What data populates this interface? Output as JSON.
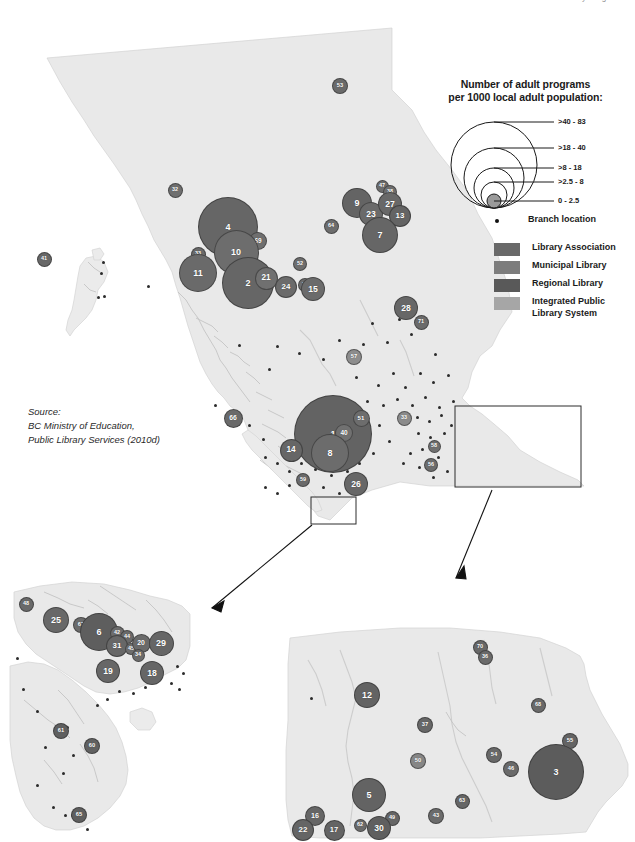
{
  "page": {
    "top_clipped_text": "Adult Library Programs",
    "background_color": "#ffffff",
    "land_color": "#e8e8e8",
    "land_stroke": "#c9c9c9"
  },
  "source_note": "Source:\nBC Ministry of Education,\nPublic Library Services (2010d)",
  "legend": {
    "title_line1": "Number of adult programs",
    "title_line2": "per 1000 local adult population:",
    "size_classes": [
      {
        "label": ">40 - 83",
        "radius": 43
      },
      {
        "label": ">18 - 40",
        "radius": 30
      },
      {
        "label": ">8 - 18",
        "radius": 20
      },
      {
        "label": ">2.5 - 8",
        "radius": 13
      },
      {
        "label": "0 - 2.5",
        "radius": 7
      }
    ],
    "branch_location_label": "Branch location",
    "branch_marker_icon": "square-dot-icon",
    "categories": [
      {
        "label": "Library Association",
        "color": "#696969"
      },
      {
        "label": "Municipal Library",
        "color": "#7d7d7d"
      },
      {
        "label": "Regional  Library",
        "color": "#595959"
      },
      {
        "label": "Integrated Public\nLibrary System",
        "color": "#a6a6a6"
      }
    ]
  },
  "main_map": {
    "name": "british-columbia-main-map",
    "bubbles": [
      {
        "id": "53",
        "x": 340,
        "y": 86,
        "r": 8,
        "color": "#6a6a6a"
      },
      {
        "id": "32",
        "x": 175,
        "y": 190,
        "r": 7.5,
        "color": "#6f6f6f"
      },
      {
        "id": "4",
        "x": 228,
        "y": 227,
        "r": 30,
        "color": "#666666"
      },
      {
        "id": "69",
        "x": 258,
        "y": 241,
        "r": 9,
        "color": "#6f6f6f"
      },
      {
        "id": "10",
        "x": 236,
        "y": 252,
        "r": 22.5,
        "color": "#6d6d6d"
      },
      {
        "id": "33",
        "x": 198,
        "y": 254,
        "r": 7.5,
        "color": "#6a6a6a"
      },
      {
        "id": "11",
        "x": 198,
        "y": 273,
        "r": 19,
        "color": "#6a6a6a"
      },
      {
        "id": "41",
        "x": 44,
        "y": 259,
        "r": 7.5,
        "color": "#686868"
      },
      {
        "id": "2",
        "x": 248,
        "y": 283,
        "r": 26,
        "color": "#666666"
      },
      {
        "id": "21",
        "x": 266,
        "y": 278,
        "r": 11.5,
        "color": "#707070"
      },
      {
        "id": "24",
        "x": 286,
        "y": 287,
        "r": 11,
        "color": "#6b6b6b"
      },
      {
        "id": "52",
        "x": 300,
        "y": 264,
        "r": 7,
        "color": "#6e6e6e"
      },
      {
        "id": "39",
        "x": 305,
        "y": 285,
        "r": 7,
        "color": "#6c6c6c"
      },
      {
        "id": "15",
        "x": 313,
        "y": 289,
        "r": 12,
        "color": "#6b6b6b"
      },
      {
        "id": "64",
        "x": 331,
        "y": 226,
        "r": 7.5,
        "color": "#6d6d6d"
      },
      {
        "id": "9",
        "x": 357,
        "y": 203,
        "r": 15,
        "color": "#646464"
      },
      {
        "id": "23",
        "x": 371,
        "y": 214,
        "r": 12,
        "color": "#6a6a6a"
      },
      {
        "id": "47",
        "x": 382,
        "y": 186,
        "r": 6.5,
        "color": "#6c6c6c"
      },
      {
        "id": "38",
        "x": 390,
        "y": 192,
        "r": 7,
        "color": "#6e6e6e"
      },
      {
        "id": "27",
        "x": 390,
        "y": 204,
        "r": 12,
        "color": "#686868"
      },
      {
        "id": "13",
        "x": 400,
        "y": 216,
        "r": 11,
        "color": "#646464"
      },
      {
        "id": "7",
        "x": 380,
        "y": 235,
        "r": 18,
        "color": "#666666"
      },
      {
        "id": "28",
        "x": 406,
        "y": 308,
        "r": 12,
        "color": "#676767"
      },
      {
        "id": "71",
        "x": 421,
        "y": 322,
        "r": 7.5,
        "color": "#6b6b6b"
      },
      {
        "id": "57",
        "x": 354,
        "y": 357,
        "r": 8,
        "color": "#8d8d8d"
      },
      {
        "id": "66",
        "x": 233,
        "y": 418,
        "r": 9.5,
        "color": "#6a6a6a"
      },
      {
        "id": "1",
        "x": 333,
        "y": 434,
        "r": 39,
        "color": "#636363"
      },
      {
        "id": "40",
        "x": 344,
        "y": 433,
        "r": 9,
        "color": "#717171"
      },
      {
        "id": "51",
        "x": 361,
        "y": 418,
        "r": 8.5,
        "color": "#6d6d6d"
      },
      {
        "id": "8",
        "x": 330,
        "y": 453,
        "r": 19,
        "color": "#6c6c6c"
      },
      {
        "id": "14",
        "x": 291,
        "y": 450,
        "r": 11.5,
        "color": "#666666"
      },
      {
        "id": "59",
        "x": 303,
        "y": 480,
        "r": 7,
        "color": "#6a6a6a"
      },
      {
        "id": "26",
        "x": 356,
        "y": 484,
        "r": 12,
        "color": "#676767"
      },
      {
        "id": "33b",
        "x": 404,
        "y": 418,
        "r": 7.5,
        "color": "#8b8b8b",
        "display": "33"
      },
      {
        "id": "58",
        "x": 434,
        "y": 446,
        "r": 6.5,
        "color": "#6f6f6f"
      },
      {
        "id": "56",
        "x": 431,
        "y": 465,
        "r": 7,
        "color": "#6d6d6d"
      }
    ],
    "callout_rects": [
      {
        "name": "vancouver-island-callout",
        "x": 311,
        "y": 497,
        "w": 45,
        "h": 27
      },
      {
        "name": "southern-interior-callout",
        "x": 455,
        "y": 406,
        "w": 126,
        "h": 81
      }
    ]
  },
  "inset_left": {
    "name": "vancouver-island-inset",
    "bubbles": [
      {
        "id": "48",
        "x": 26,
        "y": 604,
        "r": 7.5,
        "color": "#6a6a6a"
      },
      {
        "id": "25",
        "x": 56,
        "y": 620,
        "r": 13,
        "color": "#686868"
      },
      {
        "id": "67",
        "x": 81,
        "y": 625,
        "r": 8,
        "color": "#6c6c6c"
      },
      {
        "id": "6",
        "x": 99,
        "y": 632,
        "r": 19,
        "color": "#5e5e5e"
      },
      {
        "id": "42",
        "x": 117,
        "y": 633,
        "r": 7.5,
        "color": "#6d6d6d"
      },
      {
        "id": "44",
        "x": 127,
        "y": 637,
        "r": 7,
        "color": "#6a6a6a"
      },
      {
        "id": "31",
        "x": 117,
        "y": 646,
        "r": 11,
        "color": "#676767"
      },
      {
        "id": "45",
        "x": 131,
        "y": 649,
        "r": 6,
        "color": "#6e6e6e"
      },
      {
        "id": "20",
        "x": 141,
        "y": 643,
        "r": 9.5,
        "color": "#6a6a6a"
      },
      {
        "id": "34",
        "x": 138,
        "y": 655,
        "r": 6.5,
        "color": "#6b6b6b"
      },
      {
        "id": "29",
        "x": 161,
        "y": 643,
        "r": 12.5,
        "color": "#666666"
      },
      {
        "id": "19",
        "x": 108,
        "y": 671,
        "r": 12,
        "color": "#676767"
      },
      {
        "id": "18",
        "x": 152,
        "y": 673,
        "r": 12,
        "color": "#666666"
      },
      {
        "id": "61",
        "x": 61,
        "y": 731,
        "r": 8,
        "color": "#5f5f5f"
      },
      {
        "id": "60",
        "x": 92,
        "y": 746,
        "r": 8,
        "color": "#616161"
      },
      {
        "id": "65",
        "x": 79,
        "y": 815,
        "r": 8,
        "color": "#5f5f5f"
      }
    ]
  },
  "inset_right": {
    "name": "southern-interior-inset",
    "bubbles": [
      {
        "id": "70",
        "x": 480,
        "y": 647,
        "r": 7.5,
        "color": "#686868"
      },
      {
        "id": "36",
        "x": 485,
        "y": 657,
        "r": 7.5,
        "color": "#6a6a6a"
      },
      {
        "id": "12",
        "x": 367,
        "y": 695,
        "r": 13,
        "color": "#636363"
      },
      {
        "id": "68",
        "x": 538,
        "y": 705,
        "r": 7.5,
        "color": "#6a6a6a"
      },
      {
        "id": "37",
        "x": 425,
        "y": 725,
        "r": 8,
        "color": "#676767"
      },
      {
        "id": "55",
        "x": 570,
        "y": 741,
        "r": 8,
        "color": "#646464"
      },
      {
        "id": "54",
        "x": 494,
        "y": 755,
        "r": 8,
        "color": "#686868"
      },
      {
        "id": "50",
        "x": 418,
        "y": 761,
        "r": 8,
        "color": "#868686"
      },
      {
        "id": "46",
        "x": 511,
        "y": 769,
        "r": 8,
        "color": "#6a6a6a"
      },
      {
        "id": "3",
        "x": 556,
        "y": 772,
        "r": 28,
        "color": "#5c5c5c"
      },
      {
        "id": "5",
        "x": 369,
        "y": 795,
        "r": 17,
        "color": "#636363"
      },
      {
        "id": "63",
        "x": 462,
        "y": 801,
        "r": 7.5,
        "color": "#666666"
      },
      {
        "id": "16",
        "x": 315,
        "y": 816,
        "r": 10,
        "color": "#666666"
      },
      {
        "id": "43",
        "x": 436,
        "y": 816,
        "r": 8,
        "color": "#6b6b6b"
      },
      {
        "id": "49",
        "x": 392,
        "y": 818,
        "r": 7.5,
        "color": "#666666"
      },
      {
        "id": "62",
        "x": 360,
        "y": 825,
        "r": 6.5,
        "color": "#6a6a6a"
      },
      {
        "id": "22",
        "x": 303,
        "y": 830,
        "r": 11,
        "color": "#656565"
      },
      {
        "id": "17",
        "x": 334,
        "y": 830,
        "r": 10.5,
        "color": "#646464"
      },
      {
        "id": "30",
        "x": 379,
        "y": 828,
        "r": 12,
        "color": "#5f5f5f"
      }
    ]
  }
}
